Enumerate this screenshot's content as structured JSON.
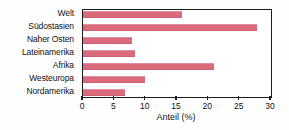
{
  "chart_data": {
    "type": "bar",
    "orientation": "horizontal",
    "title": "",
    "xlabel": "Anteil (%)",
    "ylabel": "",
    "categories": [
      "Welt",
      "Südostasien",
      "Naher Osten",
      "Lateinamerika",
      "Afrika",
      "Westeuropa",
      "Nordamerika"
    ],
    "values": [
      15.8,
      27.7,
      7.8,
      8.3,
      20.9,
      9.9,
      6.7
    ],
    "xlim": [
      0,
      30
    ],
    "xticks": [
      0,
      5,
      10,
      15,
      20,
      25,
      30
    ],
    "xtick_labels": [
      "0",
      "5",
      "10",
      "15",
      "20",
      "25",
      "30"
    ],
    "grid": false,
    "legend": false,
    "bar_color": "#d96b7c",
    "axis_color": "#1c1c1c",
    "background_color": "#ffffff"
  }
}
